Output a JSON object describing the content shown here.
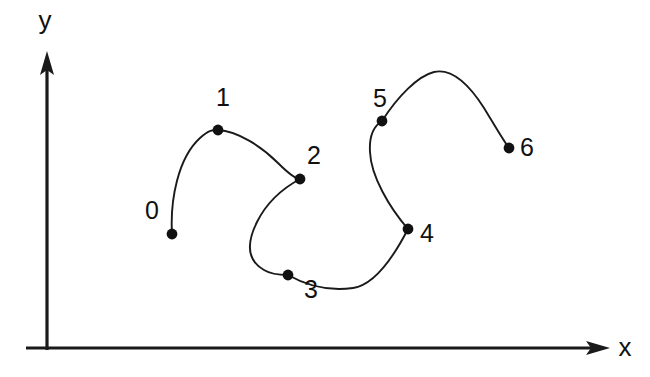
{
  "figure": {
    "title": "",
    "background": "#ffffff",
    "width": 650,
    "height": 377,
    "stroke_color": "#1a1a1a",
    "point_color": "#111111"
  },
  "axes": {
    "x_label": "x",
    "y_label": "y",
    "x_axis": {
      "x1": 47,
      "y1": 348,
      "x2": 598,
      "y2": 348
    },
    "y_axis": {
      "x1": 47,
      "y1": 348,
      "x2": 47,
      "y2": 60
    },
    "x_label_pos": {
      "x": 625,
      "y": 348
    },
    "y_label_pos": {
      "x": 45,
      "y": 22
    },
    "show_ticks": false,
    "show_grid": false
  },
  "chart_data": {
    "type": "line",
    "title": "",
    "xlabel": "x",
    "ylabel": "y",
    "grid": false,
    "legend": null,
    "curve_kind": "interpolating-spline-through-control-points",
    "labels": [
      "0",
      "1",
      "2",
      "3",
      "4",
      "5",
      "6"
    ],
    "points": [
      {
        "label": "0",
        "x": 172,
        "y": 234,
        "label_x": 152,
        "label_y": 212
      },
      {
        "label": "1",
        "x": 218,
        "y": 130,
        "label_x": 223,
        "label_y": 99
      },
      {
        "label": "2",
        "x": 300,
        "y": 179,
        "label_x": 314,
        "label_y": 157
      },
      {
        "label": "3",
        "x": 288,
        "y": 275,
        "label_x": 311,
        "label_y": 291
      },
      {
        "label": "4",
        "x": 408,
        "y": 229,
        "label_x": 427,
        "label_y": 235
      },
      {
        "label": "5",
        "x": 382,
        "y": 121,
        "label_x": 380,
        "label_y": 100
      },
      {
        "label": "6",
        "x": 509,
        "y": 148,
        "label_x": 527,
        "label_y": 149
      }
    ],
    "point_radius": 5.4,
    "path_d": "M 172 234 C 170 200 178 158 200 138 C 210 129 214 130 218 130 C 238 131 262 147 278 163 C 288 173 295 179 300 179 C 287 186 268 200 257 222 C 244 248 250 262 264 270 C 272 275 281 275 288 275 C 309 287 331 291 353 288 C 374 285 392 260 408 229 C 389 207 371 176 370 152 C 369 136 374 126 382 121 C 398 96 418 76 434 72 C 452 68 470 86 484 108 C 495 126 503 140 509 148"
  }
}
